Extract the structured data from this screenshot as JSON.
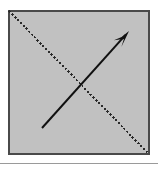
{
  "figure": {
    "canvas": {
      "width": 158,
      "height": 169,
      "background": "#ffffff"
    }
  },
  "panel": {
    "name": "square-panel",
    "fill": "#c1c1c1",
    "border_color": "#4a4a4a",
    "border_width": 2,
    "x": 8,
    "y": 10,
    "width": 142,
    "height": 145
  },
  "dotted_diagonal": {
    "label": "dotted-diagonal-line",
    "color": "#2b2b2b",
    "stroke_width": 2,
    "dash_pattern": "2 2",
    "from": {
      "x": 9,
      "y": 11
    },
    "to": {
      "x": 149,
      "y": 154
    },
    "direction": "top-left to bottom-right"
  },
  "arrow": {
    "label": "solid-arrow",
    "color": "#111111",
    "stroke_width": 2,
    "tail": {
      "x": 42,
      "y": 128
    },
    "tip": {
      "x": 129,
      "y": 31
    },
    "direction": "bottom-left to top-right",
    "head_style": "barbed",
    "head_length": 17,
    "head_half_width": 5
  },
  "separator": {
    "label": "horizontal-rule",
    "color": "#9a9a9a",
    "thickness": 1,
    "y": 163,
    "x_start": 0,
    "x_end": 158
  }
}
